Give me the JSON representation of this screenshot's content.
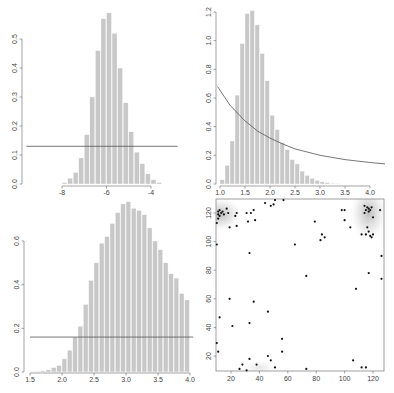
{
  "chart_data": [
    {
      "type": "bar",
      "panel": "top-left",
      "title": "",
      "xlabel": "",
      "ylabel": "",
      "xlim": [
        -8,
        -3.5
      ],
      "ylim": [
        0,
        0.5
      ],
      "xticks": [
        "-8",
        "-6",
        "-4"
      ],
      "yticks": [
        "0.0",
        "0.1",
        "0.2",
        "0.3",
        "0.4",
        "0.5"
      ],
      "bin_width": 0.25,
      "bin_starts": [
        -8.0,
        -7.75,
        -7.5,
        -7.25,
        -7.0,
        -6.75,
        -6.5,
        -6.25,
        -6.0,
        -5.75,
        -5.5,
        -5.25,
        -5.0,
        -4.75,
        -4.5,
        -4.25,
        -4.0,
        -3.75
      ],
      "values": [
        0.005,
        0.02,
        0.04,
        0.09,
        0.17,
        0.3,
        0.46,
        0.57,
        0.59,
        0.52,
        0.4,
        0.28,
        0.18,
        0.11,
        0.07,
        0.035,
        0.015,
        0.005
      ],
      "overlay": {
        "type": "hline",
        "y": 0.13,
        "x_from": -9.6,
        "x_to": -2.8
      },
      "grid": false
    },
    {
      "type": "bar",
      "panel": "top-right",
      "title": "",
      "xlabel": "",
      "ylabel": "",
      "xlim": [
        1.0,
        4.0
      ],
      "ylim": [
        0,
        1.2
      ],
      "xticks": [
        "1.0",
        "1.5",
        "2.0",
        "2.5",
        "3.0",
        "3.5",
        "4.0"
      ],
      "yticks": [
        "0.0",
        "0.2",
        "0.4",
        "0.6",
        "0.8",
        "1.0",
        "1.2"
      ],
      "bin_width": 0.1,
      "bin_starts": [
        1.0,
        1.1,
        1.2,
        1.3,
        1.4,
        1.5,
        1.6,
        1.7,
        1.8,
        1.9,
        2.0,
        2.1,
        2.2,
        2.3,
        2.4,
        2.5,
        2.6,
        2.7,
        2.8,
        2.9,
        3.0,
        3.1,
        3.2,
        3.3
      ],
      "values": [
        0.03,
        0.13,
        0.3,
        0.62,
        0.98,
        1.19,
        1.21,
        1.11,
        0.91,
        0.72,
        0.48,
        0.38,
        0.29,
        0.24,
        0.17,
        0.14,
        0.09,
        0.06,
        0.04,
        0.025,
        0.015,
        0.01,
        0.005,
        0.003
      ],
      "overlay": {
        "type": "curve",
        "description": "decreasing density curve",
        "points": [
          [
            0.95,
            0.68
          ],
          [
            1.2,
            0.55
          ],
          [
            1.5,
            0.44
          ],
          [
            1.75,
            0.37
          ],
          [
            2.0,
            0.32
          ],
          [
            2.25,
            0.28
          ],
          [
            2.5,
            0.245
          ],
          [
            3.0,
            0.2
          ],
          [
            3.5,
            0.17
          ],
          [
            4.0,
            0.15
          ],
          [
            4.3,
            0.14
          ]
        ]
      },
      "grid": false
    },
    {
      "type": "bar",
      "panel": "bottom-left",
      "title": "",
      "xlabel": "",
      "ylabel": "",
      "xlim": [
        1.5,
        4.0
      ],
      "ylim": [
        0,
        0.6
      ],
      "xticks": [
        "1.5",
        "2.0",
        "2.5",
        "3.0",
        "3.5",
        "4.0"
      ],
      "yticks": [
        "0.0",
        "0.2",
        "0.4",
        "0.6"
      ],
      "bin_width": 0.0833,
      "bin_starts": [
        1.5,
        1.583,
        1.667,
        1.75,
        1.833,
        1.917,
        2.0,
        2.083,
        2.167,
        2.25,
        2.333,
        2.417,
        2.5,
        2.583,
        2.667,
        2.75,
        2.833,
        2.917,
        3.0,
        3.083,
        3.167,
        3.25,
        3.333,
        3.417,
        3.5,
        3.583,
        3.667,
        3.75,
        3.833,
        3.917
      ],
      "values": [
        0.002,
        0.003,
        0.005,
        0.01,
        0.02,
        0.03,
        0.06,
        0.1,
        0.16,
        0.21,
        0.31,
        0.42,
        0.5,
        0.59,
        0.62,
        0.68,
        0.73,
        0.77,
        0.78,
        0.75,
        0.74,
        0.72,
        0.66,
        0.6,
        0.56,
        0.5,
        0.45,
        0.43,
        0.36,
        0.33
      ],
      "overlay": {
        "type": "hline",
        "y": 0.16,
        "x_from": 1.5,
        "x_to": 4.05
      },
      "grid": false
    },
    {
      "type": "scatter",
      "panel": "bottom-right",
      "title": "",
      "xlabel": "",
      "ylabel": "",
      "xlim": [
        10,
        130
      ],
      "ylim": [
        10,
        130
      ],
      "xticks": [
        "20",
        "40",
        "60",
        "80",
        "100",
        "120"
      ],
      "yticks": [
        "20",
        "40",
        "60",
        "80",
        "100",
        "120"
      ],
      "background": "kernel density shading (grey) around clusters at top-left (~12,120) and top-right (~117,122)",
      "points": [
        [
          11,
          121
        ],
        [
          11,
          119
        ],
        [
          12,
          118
        ],
        [
          12,
          122
        ],
        [
          13,
          120
        ],
        [
          14,
          121
        ],
        [
          11,
          116
        ],
        [
          10,
          113
        ],
        [
          15,
          119
        ],
        [
          17,
          123
        ],
        [
          18,
          120
        ],
        [
          19,
          110
        ],
        [
          24,
          120
        ],
        [
          23,
          118
        ],
        [
          24,
          111
        ],
        [
          31,
          120
        ],
        [
          32,
          114
        ],
        [
          34,
          120
        ],
        [
          36,
          122
        ],
        [
          37,
          115
        ],
        [
          44,
          127
        ],
        [
          48,
          125
        ],
        [
          50,
          126
        ],
        [
          51,
          129
        ],
        [
          57,
          129
        ],
        [
          10,
          98
        ],
        [
          33,
          92
        ],
        [
          65,
          98
        ],
        [
          73,
          76
        ],
        [
          79,
          114
        ],
        [
          83,
          101
        ],
        [
          84,
          105
        ],
        [
          86,
          103
        ],
        [
          98,
          122
        ],
        [
          100,
          122
        ],
        [
          100,
          115
        ],
        [
          104,
          110
        ],
        [
          108,
          67
        ],
        [
          112,
          105
        ],
        [
          114,
          125
        ],
        [
          114,
          120
        ],
        [
          115,
          122
        ],
        [
          116,
          124
        ],
        [
          117,
          121
        ],
        [
          117,
          123
        ],
        [
          118,
          122
        ],
        [
          119,
          124
        ],
        [
          116,
          110
        ],
        [
          117,
          107
        ],
        [
          118,
          104
        ],
        [
          119,
          103
        ],
        [
          115,
          105
        ],
        [
          120,
          117
        ],
        [
          120,
          105
        ],
        [
          125,
          122
        ],
        [
          126,
          90
        ],
        [
          126,
          74
        ],
        [
          117,
          78
        ],
        [
          19,
          60
        ],
        [
          36,
          58
        ],
        [
          12,
          47
        ],
        [
          21,
          41
        ],
        [
          33,
          43
        ],
        [
          46,
          51
        ],
        [
          10,
          29
        ],
        [
          11,
          23
        ],
        [
          56,
          32
        ],
        [
          56,
          23
        ],
        [
          46,
          20
        ],
        [
          33,
          18
        ],
        [
          28,
          14
        ],
        [
          38,
          14
        ],
        [
          26,
          11
        ],
        [
          31,
          10
        ],
        [
          48,
          17
        ],
        [
          51,
          12
        ],
        [
          73,
          11
        ],
        [
          106,
          17
        ],
        [
          112,
          12
        ],
        [
          115,
          12
        ]
      ],
      "grid": false
    }
  ]
}
